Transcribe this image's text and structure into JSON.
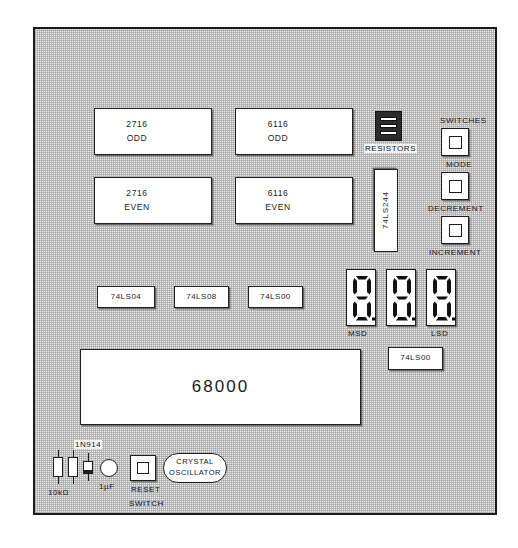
{
  "board": {
    "title": "68000 microprocessor trainer board layout",
    "background_color": "#ececec",
    "outline_color": "#1a1a1a"
  },
  "memory_chips": [
    {
      "part": "2716",
      "bank": "ODD"
    },
    {
      "part": "6116",
      "bank": "ODD"
    },
    {
      "part": "2716",
      "bank": "EVEN"
    },
    {
      "part": "6116",
      "bank": "EVEN"
    }
  ],
  "logic_chips": [
    {
      "part": "74LS04"
    },
    {
      "part": "74LS08"
    },
    {
      "part": "74LS00"
    }
  ],
  "buffer_chip": {
    "part": "74LS244"
  },
  "decoder_chip": {
    "part": "74LS00"
  },
  "cpu": {
    "part": "68000"
  },
  "resistor_pack": {
    "label": "RESISTORS",
    "element_count": 3
  },
  "switches": {
    "group_label": "SWITCHES",
    "buttons": [
      {
        "label": "MODE"
      },
      {
        "label": "DECREMENT"
      },
      {
        "label": "INCREMENT"
      }
    ]
  },
  "display": {
    "digit_count": 3,
    "msd_label": "MSD",
    "lsd_label": "LSD",
    "segments_on": [
      "a",
      "b",
      "c",
      "d",
      "e",
      "f",
      "g",
      "dp"
    ]
  },
  "discretes": {
    "resistors_label": "10kΩ",
    "resistor_count": 2,
    "diode_label": "1N914",
    "capacitor_label": "1µF",
    "reset_switch_label_line1": "RESET",
    "reset_switch_label_line2": "SWITCH",
    "oscillator_label_line1": "CRYSTAL",
    "oscillator_label_line2": "OSCILLATOR"
  }
}
